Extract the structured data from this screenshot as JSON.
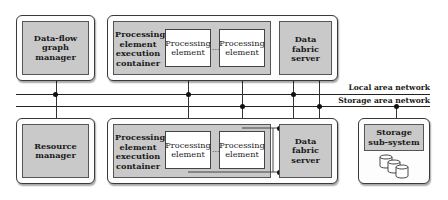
{
  "diagram": {
    "type": "system-architecture",
    "top_row": {
      "dataflow_manager": {
        "label": "Data-flow graph manager"
      },
      "pe_container": {
        "container_label": "Processing element execution container",
        "elements": [
          {
            "label": "Processing element"
          },
          {
            "label": "Processing element"
          }
        ],
        "ellipsis": "..."
      },
      "data_fabric_server": {
        "label": "Data fabric server"
      }
    },
    "networks": {
      "lan": {
        "label": "Local area network"
      },
      "san": {
        "label": "Storage area network"
      }
    },
    "bottom_row": {
      "resource_manager": {
        "label": "Resource manager"
      },
      "pe_container": {
        "container_label": "Processing element execution container",
        "elements": [
          {
            "label": "Processing element"
          },
          {
            "label": "Processing element"
          }
        ],
        "ellipsis": "..."
      },
      "data_fabric_server": {
        "label": "Data fabric server"
      },
      "storage": {
        "label": "Storage sub-system",
        "disk_count": 3
      }
    },
    "colors": {
      "component_fill": "#c9c9c9",
      "element_fill": "#ffffff",
      "line": "#222222"
    }
  }
}
